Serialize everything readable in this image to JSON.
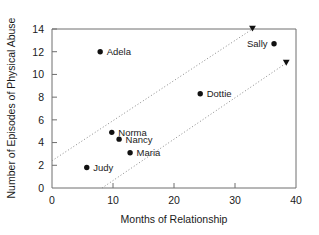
{
  "chart_data": {
    "type": "scatter",
    "title": "",
    "xlabel": "Months of Relationship",
    "ylabel": "Number of Episodes of Physical Abuse",
    "xlim": [
      0,
      40
    ],
    "ylim": [
      0,
      14
    ],
    "xticks": [
      0,
      10,
      20,
      30,
      40
    ],
    "yticks": [
      0,
      2,
      4,
      6,
      8,
      10,
      12,
      14
    ],
    "xtick_labels": [
      "0",
      "10",
      "20",
      "30",
      "40"
    ],
    "ytick_labels": [
      "0",
      "2",
      "4",
      "6",
      "8",
      "10",
      "12",
      "14"
    ],
    "grid": false,
    "legend": "none",
    "points": [
      {
        "label": "Adela",
        "x": 7.9,
        "y": 12.0,
        "label_side": "right"
      },
      {
        "label": "Norma",
        "x": 9.8,
        "y": 4.9,
        "label_side": "right"
      },
      {
        "label": "Nancy",
        "x": 11.0,
        "y": 4.3,
        "label_side": "right"
      },
      {
        "label": "Maria",
        "x": 12.8,
        "y": 3.1,
        "label_side": "right"
      },
      {
        "label": "Judy",
        "x": 5.7,
        "y": 1.8,
        "label_side": "right"
      },
      {
        "label": "Dottie",
        "x": 24.3,
        "y": 8.3,
        "label_side": "right"
      },
      {
        "label": "Sally",
        "x": 36.4,
        "y": 12.7,
        "label_side": "left"
      }
    ],
    "annotations": [
      {
        "name": "upper-dotted-trend-line",
        "kind": "dotted-line-with-arrow",
        "x_start": 0.0,
        "y_start": 2.4,
        "x_end": 34.0,
        "y_end": 14.4
      },
      {
        "name": "lower-dotted-trend-line",
        "kind": "dotted-line-with-arrow",
        "x_start": 8.2,
        "y_start": 0.0,
        "x_end": 38.4,
        "y_end": 11.0
      }
    ],
    "colors": {
      "marker": "#111111",
      "axis": "#6e6e6e",
      "text": "#1a1a1a",
      "trend": "#8a8a8a",
      "background": "#ffffff"
    }
  }
}
